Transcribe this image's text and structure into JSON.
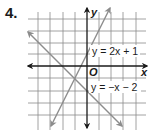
{
  "problem": {
    "number": "4."
  },
  "graph": {
    "axis_labels": {
      "x": "x",
      "y": "y",
      "origin": "O"
    },
    "origin_px": [
      87,
      66
    ],
    "unit_px": 12.3,
    "grid_x_range": [
      -4,
      4
    ],
    "grid_y_range": [
      -5,
      4
    ],
    "colors": {
      "grid": "#8a8a8a",
      "axes": "#1a1a1a",
      "lines": "#8c8c8c"
    },
    "lines": [
      {
        "equation": "y = 2x + 1",
        "slope": 2,
        "intercept": 1
      },
      {
        "equation": "y = −x − 2",
        "slope": -1,
        "intercept": -2
      }
    ],
    "intersection": [
      -1,
      -1
    ]
  }
}
